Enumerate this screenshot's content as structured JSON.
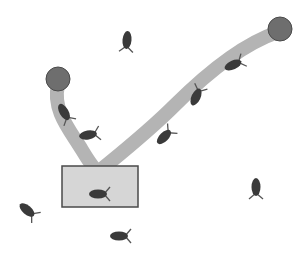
{
  "diagram": {
    "width": 303,
    "height": 258,
    "colors": {
      "background": "#ffffff",
      "path": "#b4b4b4",
      "node": "#6e6e6e",
      "node_stroke": "#4a4a4a",
      "box_fill": "#d6d6d6",
      "box_stroke": "#4a4a4a",
      "cell": "#3a3a3a",
      "flagella": "#555555"
    },
    "nodes": [
      {
        "id": "source-left",
        "cx": 58,
        "cy": 79,
        "r": 12
      },
      {
        "id": "source-right",
        "cx": 280,
        "cy": 29,
        "r": 12
      }
    ],
    "box": {
      "x": 62,
      "y": 166,
      "w": 76,
      "h": 41
    },
    "paths": [
      {
        "id": "path-left",
        "d": "M58 85 C52 110, 70 130, 82 150 C88 160, 92 166, 96 170"
      },
      {
        "id": "path-right",
        "d": "M278 32 C240 45, 205 75, 175 105 C150 130, 125 150, 103 168"
      }
    ],
    "cells": [
      {
        "x": 127,
        "y": 40,
        "angle": 95
      },
      {
        "x": 64,
        "y": 112,
        "angle": 60
      },
      {
        "x": 88,
        "y": 135,
        "angle": -10
      },
      {
        "x": 196,
        "y": 97,
        "angle": -65
      },
      {
        "x": 233,
        "y": 65,
        "angle": -25
      },
      {
        "x": 164,
        "y": 137,
        "angle": -45
      },
      {
        "x": 98,
        "y": 194,
        "angle": 0
      },
      {
        "x": 256,
        "y": 187,
        "angle": 90
      },
      {
        "x": 27,
        "y": 210,
        "angle": 40
      },
      {
        "x": 119,
        "y": 236,
        "angle": 0
      }
    ]
  }
}
